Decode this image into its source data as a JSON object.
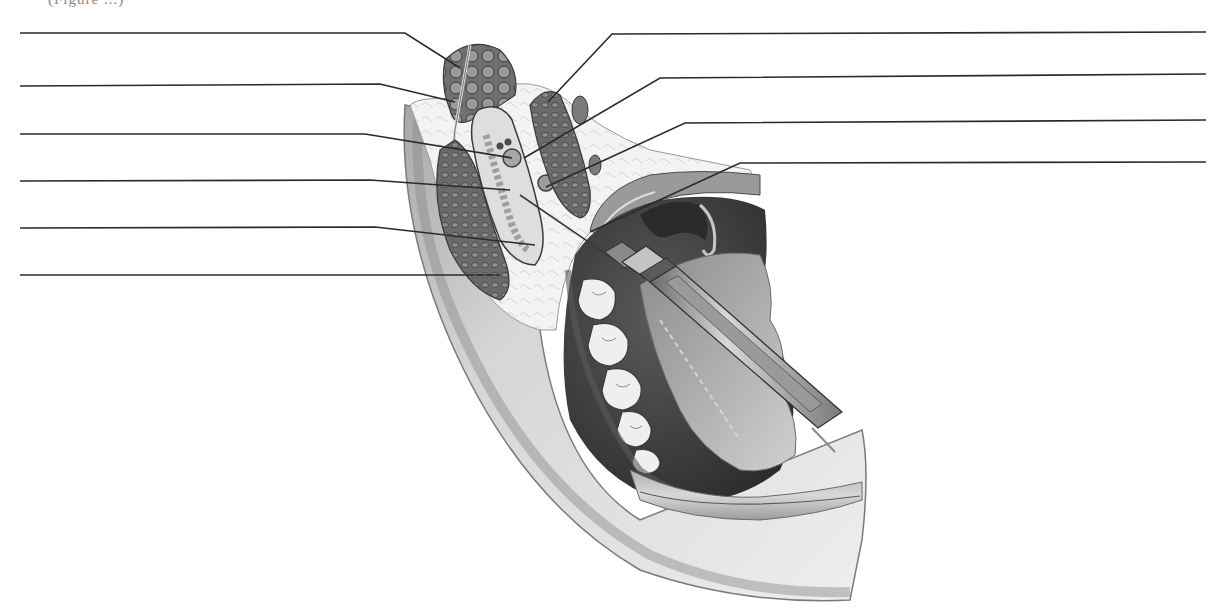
{
  "figure": {
    "caption_fragment": "(Figure ...)",
    "colors": {
      "background": "#ffffff",
      "leader_line": "#2a2a2a",
      "skin_light": "#e6e6e6",
      "skin_mid": "#c8c8c8",
      "skin_dark": "#8a8a8a",
      "fat": "#f2f2f2",
      "muscle": "#6e6e6e",
      "muscle_dark": "#4a4a4a",
      "bone": "#d9d9d9",
      "mouth_dark": "#3a3a3a",
      "tongue": "#9a9a9a",
      "tooth": "#f0f0f0",
      "syringe_metal": "#bdbdbd",
      "syringe_dark": "#5a5a5a"
    }
  },
  "leader_lines": {
    "left": [
      {
        "id": "L1",
        "label": "",
        "points": [
          [
            20,
            33
          ],
          [
            405,
            33
          ],
          [
            460,
            68
          ]
        ]
      },
      {
        "id": "L2",
        "label": "",
        "points": [
          [
            20,
            86
          ],
          [
            380,
            84
          ],
          [
            455,
            102
          ]
        ]
      },
      {
        "id": "L3",
        "label": "",
        "points": [
          [
            20,
            134
          ],
          [
            365,
            134
          ],
          [
            512,
            158
          ]
        ]
      },
      {
        "id": "L4",
        "label": "",
        "points": [
          [
            20,
            181
          ],
          [
            370,
            180
          ],
          [
            510,
            190
          ]
        ]
      },
      {
        "id": "L5",
        "label": "",
        "points": [
          [
            20,
            228
          ],
          [
            375,
            227
          ],
          [
            535,
            245
          ]
        ]
      },
      {
        "id": "L6",
        "label": "",
        "points": [
          [
            20,
            275
          ],
          [
            500,
            275
          ]
        ]
      }
    ],
    "right": [
      {
        "id": "R1",
        "label": "",
        "points": [
          [
            1206,
            32
          ],
          [
            612,
            34
          ],
          [
            548,
            102
          ]
        ]
      },
      {
        "id": "R2",
        "label": "",
        "points": [
          [
            1206,
            74
          ],
          [
            660,
            78
          ],
          [
            524,
            158
          ]
        ]
      },
      {
        "id": "R3",
        "label": "",
        "points": [
          [
            1206,
            120
          ],
          [
            685,
            123
          ],
          [
            546,
            187
          ]
        ]
      },
      {
        "id": "R4",
        "label": "",
        "points": [
          [
            1206,
            162
          ],
          [
            740,
            163
          ],
          [
            590,
            232
          ]
        ]
      }
    ]
  }
}
